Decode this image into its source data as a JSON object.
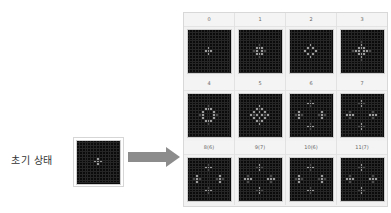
{
  "initial": {
    "label": "초기 상태",
    "cells": [
      [
        6,
        7
      ],
      [
        7,
        6
      ],
      [
        7,
        7
      ],
      [
        7,
        8
      ],
      [
        8,
        7
      ]
    ]
  },
  "arrow": {
    "color": "#8c8c8c"
  },
  "colors": {
    "background": "#0b0b0b",
    "live": "#9a9a9a",
    "faded": "#4a4a4a",
    "gridline": "#262626"
  },
  "generations": [
    {
      "label": "0",
      "cells": [
        [
          6,
          7
        ],
        [
          7,
          6
        ],
        [
          7,
          7
        ],
        [
          7,
          8
        ],
        [
          8,
          7
        ]
      ],
      "dim": []
    },
    {
      "label": "1",
      "cells": [
        [
          6,
          6
        ],
        [
          6,
          7
        ],
        [
          6,
          8
        ],
        [
          7,
          6
        ],
        [
          7,
          8
        ],
        [
          8,
          6
        ],
        [
          8,
          7
        ],
        [
          8,
          8
        ]
      ],
      "dim": [
        [
          5,
          7
        ],
        [
          7,
          5
        ],
        [
          7,
          9
        ],
        [
          9,
          7
        ]
      ]
    },
    {
      "label": "2",
      "cells": [
        [
          5,
          7
        ],
        [
          6,
          6
        ],
        [
          6,
          8
        ],
        [
          7,
          5
        ],
        [
          7,
          9
        ],
        [
          8,
          6
        ],
        [
          8,
          8
        ],
        [
          9,
          7
        ]
      ],
      "dim": []
    },
    {
      "label": "3",
      "cells": [
        [
          5,
          7
        ],
        [
          6,
          6
        ],
        [
          6,
          7
        ],
        [
          6,
          8
        ],
        [
          7,
          5
        ],
        [
          7,
          6
        ],
        [
          7,
          8
        ],
        [
          7,
          9
        ],
        [
          8,
          6
        ],
        [
          8,
          7
        ],
        [
          8,
          8
        ],
        [
          9,
          7
        ]
      ],
      "dim": [
        [
          4,
          7
        ],
        [
          7,
          4
        ],
        [
          7,
          10
        ],
        [
          10,
          7
        ]
      ]
    },
    {
      "label": "4",
      "cells": [
        [
          5,
          6
        ],
        [
          5,
          7
        ],
        [
          5,
          8
        ],
        [
          6,
          5
        ],
        [
          6,
          9
        ],
        [
          7,
          5
        ],
        [
          7,
          9
        ],
        [
          8,
          5
        ],
        [
          8,
          9
        ],
        [
          9,
          6
        ],
        [
          9,
          7
        ],
        [
          9,
          8
        ]
      ],
      "dim": [
        [
          4,
          7
        ],
        [
          10,
          7
        ],
        [
          7,
          4
        ],
        [
          7,
          10
        ]
      ]
    },
    {
      "label": "5",
      "cells": [
        [
          4,
          7
        ],
        [
          5,
          6
        ],
        [
          5,
          8
        ],
        [
          6,
          5
        ],
        [
          6,
          7
        ],
        [
          6,
          9
        ],
        [
          7,
          4
        ],
        [
          7,
          6
        ],
        [
          7,
          8
        ],
        [
          7,
          10
        ],
        [
          8,
          5
        ],
        [
          8,
          7
        ],
        [
          8,
          9
        ],
        [
          9,
          6
        ],
        [
          9,
          8
        ],
        [
          10,
          7
        ]
      ],
      "dim": [
        [
          5,
          7
        ],
        [
          7,
          5
        ],
        [
          7,
          9
        ],
        [
          9,
          7
        ]
      ]
    },
    {
      "label": "6",
      "cells": [
        [
          3,
          6
        ],
        [
          3,
          7
        ],
        [
          3,
          8
        ],
        [
          6,
          3
        ],
        [
          7,
          3
        ],
        [
          8,
          3
        ],
        [
          6,
          11
        ],
        [
          7,
          11
        ],
        [
          8,
          11
        ],
        [
          11,
          6
        ],
        [
          11,
          7
        ],
        [
          11,
          8
        ]
      ],
      "dim": [
        [
          2,
          7
        ],
        [
          4,
          7
        ],
        [
          7,
          2
        ],
        [
          7,
          4
        ],
        [
          7,
          10
        ],
        [
          7,
          12
        ],
        [
          10,
          7
        ],
        [
          12,
          7
        ]
      ]
    },
    {
      "label": "7",
      "cells": [
        [
          2,
          7
        ],
        [
          3,
          7
        ],
        [
          4,
          7
        ],
        [
          7,
          2
        ],
        [
          7,
          3
        ],
        [
          7,
          4
        ],
        [
          7,
          10
        ],
        [
          7,
          11
        ],
        [
          7,
          12
        ],
        [
          10,
          7
        ],
        [
          11,
          7
        ],
        [
          12,
          7
        ]
      ],
      "dim": [
        [
          3,
          6
        ],
        [
          3,
          8
        ],
        [
          6,
          3
        ],
        [
          8,
          3
        ],
        [
          6,
          11
        ],
        [
          8,
          11
        ],
        [
          11,
          6
        ],
        [
          11,
          8
        ]
      ]
    },
    {
      "label": "8(6)",
      "cells": [
        [
          3,
          6
        ],
        [
          3,
          7
        ],
        [
          3,
          8
        ],
        [
          6,
          3
        ],
        [
          7,
          3
        ],
        [
          8,
          3
        ],
        [
          6,
          11
        ],
        [
          7,
          11
        ],
        [
          8,
          11
        ],
        [
          11,
          6
        ],
        [
          11,
          7
        ],
        [
          11,
          8
        ]
      ],
      "dim": [
        [
          2,
          7
        ],
        [
          4,
          7
        ],
        [
          7,
          2
        ],
        [
          7,
          4
        ],
        [
          7,
          10
        ],
        [
          7,
          12
        ],
        [
          10,
          7
        ],
        [
          12,
          7
        ]
      ]
    },
    {
      "label": "9(7)",
      "cells": [
        [
          2,
          7
        ],
        [
          3,
          7
        ],
        [
          4,
          7
        ],
        [
          7,
          2
        ],
        [
          7,
          3
        ],
        [
          7,
          4
        ],
        [
          7,
          10
        ],
        [
          7,
          11
        ],
        [
          7,
          12
        ],
        [
          10,
          7
        ],
        [
          11,
          7
        ],
        [
          12,
          7
        ]
      ],
      "dim": [
        [
          3,
          6
        ],
        [
          3,
          8
        ],
        [
          6,
          3
        ],
        [
          8,
          3
        ],
        [
          6,
          11
        ],
        [
          8,
          11
        ],
        [
          11,
          6
        ],
        [
          11,
          8
        ]
      ]
    },
    {
      "label": "10(6)",
      "cells": [
        [
          3,
          6
        ],
        [
          3,
          7
        ],
        [
          3,
          8
        ],
        [
          6,
          3
        ],
        [
          7,
          3
        ],
        [
          8,
          3
        ],
        [
          6,
          11
        ],
        [
          7,
          11
        ],
        [
          8,
          11
        ],
        [
          11,
          6
        ],
        [
          11,
          7
        ],
        [
          11,
          8
        ]
      ],
      "dim": [
        [
          2,
          7
        ],
        [
          4,
          7
        ],
        [
          7,
          2
        ],
        [
          7,
          4
        ],
        [
          7,
          10
        ],
        [
          7,
          12
        ],
        [
          10,
          7
        ],
        [
          12,
          7
        ]
      ]
    },
    {
      "label": "11(7)",
      "cells": [
        [
          2,
          7
        ],
        [
          3,
          7
        ],
        [
          4,
          7
        ],
        [
          7,
          2
        ],
        [
          7,
          3
        ],
        [
          7,
          4
        ],
        [
          7,
          10
        ],
        [
          7,
          11
        ],
        [
          7,
          12
        ],
        [
          10,
          7
        ],
        [
          11,
          7
        ],
        [
          12,
          7
        ]
      ],
      "dim": [
        [
          3,
          6
        ],
        [
          3,
          8
        ],
        [
          6,
          3
        ],
        [
          8,
          3
        ],
        [
          6,
          11
        ],
        [
          8,
          11
        ],
        [
          11,
          6
        ],
        [
          11,
          8
        ]
      ]
    }
  ]
}
